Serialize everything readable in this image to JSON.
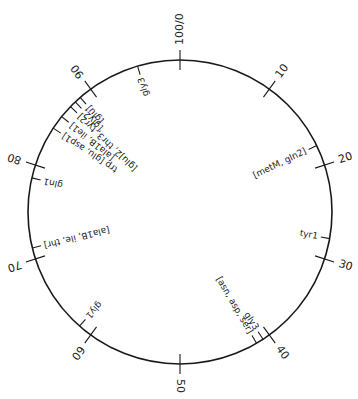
{
  "map": {
    "center": [
      180,
      212
    ],
    "radius": 152,
    "total_units": 100,
    "ticks": [
      {
        "pos": 0,
        "label": "100/0"
      },
      {
        "pos": 10,
        "label": "10"
      },
      {
        "pos": 20,
        "label": "20"
      },
      {
        "pos": 30,
        "label": "30"
      },
      {
        "pos": 40,
        "label": "40"
      },
      {
        "pos": 50,
        "label": "50"
      },
      {
        "pos": 60,
        "label": "60"
      },
      {
        "pos": 70,
        "label": "70"
      },
      {
        "pos": 80,
        "label": "80"
      },
      {
        "pos": 90,
        "label": "90"
      }
    ],
    "loci": [
      {
        "pos": 95.5,
        "label": "gly3",
        "side": "in"
      },
      {
        "pos": 88.6,
        "label": "[glu]",
        "side": "in"
      },
      {
        "pos": 87.9,
        "label": "[gly2,",
        "side": "in"
      },
      {
        "pos": 87.2,
        "label": "[glu]2, thr3, tyr2]",
        "side": "in"
      },
      {
        "pos": 85.8,
        "label": "[ala1B, ile1]",
        "side": "in"
      },
      {
        "pos": 84.3,
        "label": "trp [glu, asp1]",
        "side": "in"
      },
      {
        "pos": 78.6,
        "label": "gln1",
        "side": "in"
      },
      {
        "pos": 71.2,
        "label": "[ala1B, ile, thr]",
        "side": "in"
      },
      {
        "pos": 61.5,
        "label": "gly1",
        "side": "in"
      },
      {
        "pos": 41.6,
        "label": "[asn, asp, ser]",
        "side": "in"
      },
      {
        "pos": 40.8,
        "label": "gly3",
        "side": "in"
      },
      {
        "pos": 27.8,
        "label": "tyr1",
        "side": "in"
      },
      {
        "pos": 17.8,
        "label": "[metM, gln2]",
        "side": "in"
      }
    ]
  }
}
